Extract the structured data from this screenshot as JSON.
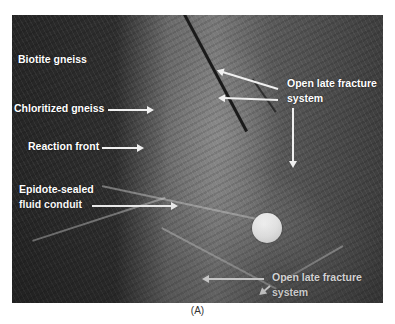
{
  "figure": {
    "caption": "(A)",
    "labels": {
      "biotite_gneiss": "Biotite gneiss",
      "chloritized_gneiss": "Chloritized gneiss",
      "reaction_front": "Reaction front",
      "epidote_line1": "Epidote-sealed",
      "epidote_line2": "fluid conduit",
      "fracture_top_line1": "Open late fracture",
      "fracture_top_line2": "system",
      "fracture_bottom_line1": "Open late fracture",
      "fracture_bottom_line2": "system"
    },
    "scale_object": "coin",
    "colors": {
      "label_text": "#ffffff",
      "arrow": "#f0f0f0",
      "background": "#ffffff"
    }
  }
}
